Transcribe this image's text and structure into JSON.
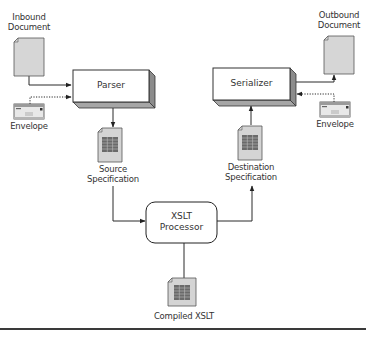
{
  "diagram": {
    "nodes": {
      "inbound_document": {
        "line1": "Inbound",
        "line2": "Document"
      },
      "outbound_document": {
        "line1": "Outbound",
        "line2": "Document"
      },
      "envelope_in": {
        "label": "Envelope"
      },
      "envelope_out": {
        "label": "Envelope"
      },
      "parser": {
        "label": "Parser"
      },
      "serializer": {
        "label": "Serializer"
      },
      "source_spec": {
        "line1": "Source",
        "line2": "Specification"
      },
      "destination_spec": {
        "line1": "Destination",
        "line2": "Specification"
      },
      "xslt_processor": {
        "line1": "XSLT",
        "line2": "Processor"
      },
      "compiled_xslt": {
        "label": "Compiled XSLT"
      }
    },
    "edges": [
      {
        "from": "Inbound Document",
        "to": "Parser",
        "style": "solid"
      },
      {
        "from": "Envelope",
        "to": "Parser",
        "style": "dotted"
      },
      {
        "from": "Parser",
        "to": "Source Specification",
        "style": "solid"
      },
      {
        "from": "Source Specification",
        "to": "XSLT Processor",
        "style": "solid"
      },
      {
        "from": "Compiled XSLT",
        "to": "XSLT Processor",
        "style": "solid-no-arrow"
      },
      {
        "from": "XSLT Processor",
        "to": "Destination Specification",
        "style": "solid"
      },
      {
        "from": "Destination Specification",
        "to": "Serializer",
        "style": "solid"
      },
      {
        "from": "Serializer",
        "to": "Outbound Document",
        "style": "solid"
      },
      {
        "from": "Envelope",
        "to": "Serializer",
        "style": "dotted"
      }
    ],
    "colors": {
      "doc_fill": "#d6d6d6",
      "doc_stroke": "#555555",
      "grid_fill": "#6e6e6e",
      "box_shadow": "#9a9a9a",
      "line": "#333333"
    }
  }
}
